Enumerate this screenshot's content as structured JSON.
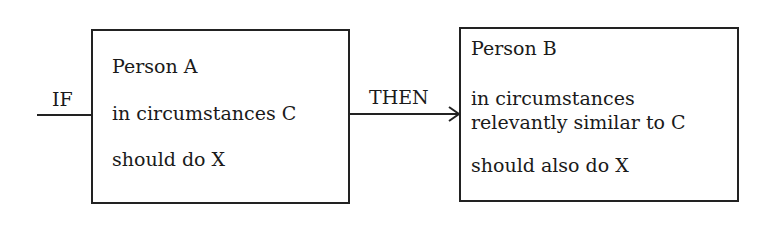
{
  "diagram": {
    "if_label": "IF",
    "then_label": "THEN",
    "box_a": {
      "line1": "Person A",
      "line2": "in circumstances C",
      "line3": "should do X"
    },
    "box_b": {
      "line1": "Person B",
      "line2": "in circumstances",
      "line3": "relevantly similar to C",
      "line4": "should also do X"
    }
  }
}
